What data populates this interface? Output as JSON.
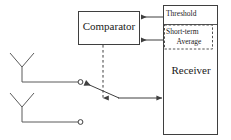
{
  "diagram": {
    "stroke_color": "#3f3f3f",
    "text_color": "#1a1a1a",
    "background_color": "#ffffff",
    "blocks": {
      "comparator": {
        "label": "Comparator",
        "x": 78,
        "y": 11,
        "w": 62,
        "h": 34
      },
      "receiver": {
        "label": "Receiver",
        "x": 163,
        "y": 5,
        "w": 55,
        "h": 130
      },
      "threshold": {
        "label": "Threshold",
        "x": 163,
        "y": 5,
        "w": 55,
        "h": 19
      },
      "short_term_average": {
        "label_line1": "Short-term",
        "label_line2": "Average",
        "x": 164,
        "y": 25,
        "w": 50,
        "h": 24,
        "border_style": "dashed"
      }
    },
    "antennas": [
      {
        "name": "antenna-upper",
        "stem_x": 22,
        "top_y": 52,
        "bottom_y": 82,
        "terminal_x": 80,
        "terminal_y": 82
      },
      {
        "name": "antenna-lower",
        "stem_x": 22,
        "top_y": 92,
        "bottom_y": 122,
        "terminal_x": 80,
        "terminal_y": 122
      }
    ],
    "connections": [
      {
        "name": "threshold-to-comparator",
        "from": "receiver",
        "to": "comparator",
        "arrow": "left",
        "y": 17
      },
      {
        "name": "average-to-comparator",
        "from": "receiver",
        "to": "comparator",
        "arrow": "left",
        "y": 40
      },
      {
        "name": "comparator-control-line",
        "from": "comparator",
        "to": "switch",
        "arrow": "down",
        "style": "dashed",
        "x": 103
      },
      {
        "name": "switch-to-receiver",
        "from": "switch",
        "to": "receiver",
        "arrow": "right",
        "y": 98
      },
      {
        "name": "switch-arm",
        "from": "switch-pivot",
        "to": "antenna-upper-terminal",
        "arrow": "up-left"
      }
    ]
  }
}
